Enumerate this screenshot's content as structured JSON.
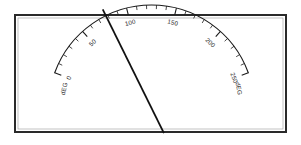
{
  "instrument": {
    "name": "analog-arc-gauge",
    "unit_label": "dEG",
    "frame_color": "#2a2a2a",
    "background_color": "#ffffff",
    "scale_color": "#1a1a1a",
    "needle_color": "#111111"
  },
  "chart_data": {
    "type": "line",
    "title": "",
    "xlabel": "",
    "ylabel": "",
    "subtitle": "",
    "grid": false,
    "legend_position": "none",
    "gauge": {
      "min": 0,
      "max": 250,
      "major_step": 50,
      "minor_step": 10,
      "start_angle_deg": 200,
      "end_angle_deg": 340,
      "needle_value": 78,
      "needle_unit": "dEG"
    },
    "categories": [
      "0",
      "50",
      "100",
      "150",
      "200",
      "250"
    ],
    "values": [
      0,
      50,
      100,
      150,
      200,
      250
    ],
    "tick_labels": [
      "0",
      "50",
      "100",
      "150",
      "200",
      "250"
    ],
    "minor_tick_values": [
      10,
      20,
      30,
      40,
      60,
      70,
      80,
      90,
      110,
      120,
      130,
      140,
      160,
      170,
      180,
      190,
      210,
      220,
      230,
      240
    ],
    "end_unit_labels": [
      "dEG",
      "dEG"
    ],
    "annotations": [
      {
        "name": "needle",
        "value": 78,
        "label": ""
      }
    ],
    "xlim": [
      0,
      250
    ],
    "ylim": [
      0,
      250
    ]
  }
}
